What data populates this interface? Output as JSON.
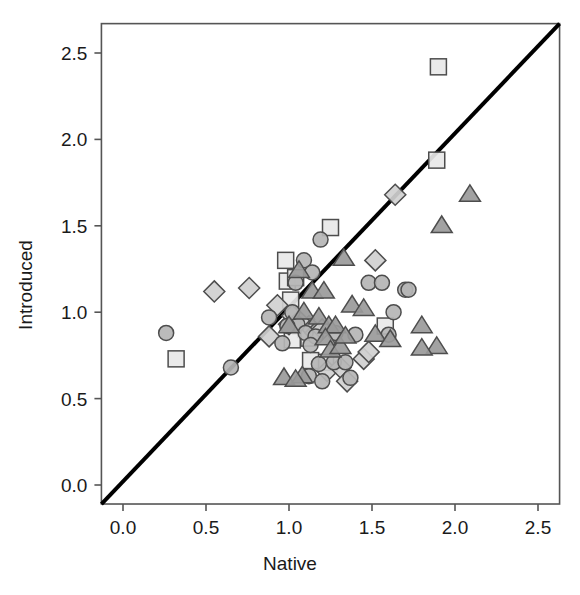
{
  "figure": {
    "background_color": "#ffffff",
    "frame_color": "#555555",
    "identity_line_color": "#000000"
  },
  "axes": {
    "x_title": "Native",
    "y_title": "Introduced",
    "x_ticks": [
      "0.0",
      "0.5",
      "1.0",
      "1.5",
      "2.0",
      "2.5"
    ],
    "y_ticks": [
      "0.0",
      "0.5",
      "1.0",
      "1.5",
      "2.0",
      "2.5"
    ]
  },
  "chart_data": {
    "type": "scatter",
    "title": "",
    "xlabel": "Native",
    "ylabel": "Introduced",
    "xlim": [
      -0.13,
      2.63
    ],
    "ylim": [
      -0.11,
      2.67
    ],
    "xticks": [
      0.0,
      0.5,
      1.0,
      1.5,
      2.0,
      2.5
    ],
    "yticks": [
      0.0,
      0.5,
      1.0,
      1.5,
      2.0,
      2.5
    ],
    "grid": false,
    "legend": null,
    "annotations": [
      {
        "type": "line",
        "name": "identity-line",
        "x": [
          -0.13,
          2.63
        ],
        "y": [
          -0.11,
          2.67
        ],
        "color": "#000000",
        "width": 4
      }
    ],
    "marker_styles": {
      "circle": {
        "fill": "#b5b5b5",
        "stroke": "#4d4d4d",
        "size": 15
      },
      "square": {
        "fill": "#e8e8e8",
        "stroke": "#4d4d4d",
        "size": 16
      },
      "triangle": {
        "fill": "#9a9a9a",
        "stroke": "#4d4d4d",
        "size": 18
      },
      "diamond": {
        "fill": "#d0d0d0",
        "stroke": "#4d4d4d",
        "size": 17
      }
    },
    "series": [
      {
        "name": "circle",
        "marker": "circle",
        "points": [
          [
            0.26,
            0.88
          ],
          [
            0.65,
            0.68
          ],
          [
            0.88,
            0.97
          ],
          [
            0.96,
            0.82
          ],
          [
            1.09,
            1.3
          ],
          [
            1.14,
            1.23
          ],
          [
            1.19,
            1.42
          ],
          [
            1.04,
            1.17
          ],
          [
            1.05,
            0.93
          ],
          [
            1.1,
            0.88
          ],
          [
            1.16,
            0.86
          ],
          [
            1.13,
            0.81
          ],
          [
            1.18,
            0.7
          ],
          [
            1.12,
            0.63
          ],
          [
            1.2,
            0.6
          ],
          [
            1.27,
            0.71
          ],
          [
            1.37,
            0.62
          ],
          [
            1.34,
            0.71
          ],
          [
            1.48,
            1.17
          ],
          [
            1.56,
            1.17
          ],
          [
            1.63,
            1.0
          ],
          [
            1.6,
            0.87
          ],
          [
            1.7,
            1.13
          ],
          [
            1.72,
            1.13
          ],
          [
            1.4,
            0.87
          ],
          [
            1.28,
            0.88
          ],
          [
            1.02,
            1.0
          ],
          [
            0.99,
            0.92
          ]
        ]
      },
      {
        "name": "square",
        "marker": "square",
        "points": [
          [
            0.32,
            0.73
          ],
          [
            0.99,
            1.18
          ],
          [
            1.04,
            1.2
          ],
          [
            0.98,
            1.3
          ],
          [
            1.01,
            1.07
          ],
          [
            1.25,
            1.49
          ],
          [
            1.07,
            0.92
          ],
          [
            1.1,
            0.9
          ],
          [
            1.12,
            0.85
          ],
          [
            1.22,
            0.71
          ],
          [
            1.58,
            0.92
          ],
          [
            1.89,
            1.88
          ],
          [
            1.9,
            2.42
          ],
          [
            1.02,
            0.84
          ],
          [
            1.13,
            0.72
          ]
        ]
      },
      {
        "name": "triangle",
        "marker": "triangle",
        "points": [
          [
            0.97,
            0.62
          ],
          [
            1.06,
            1.24
          ],
          [
            1.14,
            1.12
          ],
          [
            1.09,
            1.0
          ],
          [
            1.18,
            0.97
          ],
          [
            1.24,
            0.92
          ],
          [
            1.28,
            0.92
          ],
          [
            1.22,
            0.85
          ],
          [
            1.25,
            0.78
          ],
          [
            1.31,
            0.8
          ],
          [
            1.34,
            0.86
          ],
          [
            1.33,
            1.31
          ],
          [
            1.21,
            1.12
          ],
          [
            1.08,
            0.63
          ],
          [
            1.04,
            0.61
          ],
          [
            1.38,
            1.04
          ],
          [
            1.45,
            1.02
          ],
          [
            1.52,
            0.87
          ],
          [
            1.61,
            0.84
          ],
          [
            1.89,
            0.8
          ],
          [
            1.92,
            1.5
          ],
          [
            2.09,
            1.68
          ],
          [
            1.8,
            0.92
          ],
          [
            1.8,
            0.79
          ],
          [
            1.0,
            0.92
          ]
        ]
      },
      {
        "name": "diamond",
        "marker": "diamond",
        "points": [
          [
            0.55,
            1.12
          ],
          [
            0.76,
            1.14
          ],
          [
            0.93,
            1.04
          ],
          [
            0.88,
            0.86
          ],
          [
            1.0,
            0.93
          ],
          [
            1.12,
            0.92
          ],
          [
            1.16,
            0.88
          ],
          [
            1.2,
            0.9
          ],
          [
            1.23,
            0.66
          ],
          [
            1.31,
            0.68
          ],
          [
            1.45,
            0.73
          ],
          [
            1.48,
            0.77
          ],
          [
            1.52,
            1.3
          ],
          [
            1.64,
            1.68
          ],
          [
            1.02,
            0.98
          ],
          [
            1.06,
            0.95
          ],
          [
            1.35,
            0.6
          ]
        ]
      }
    ]
  }
}
